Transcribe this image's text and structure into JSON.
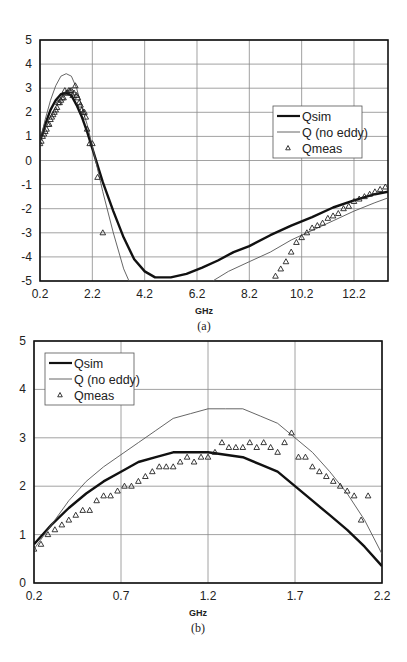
{
  "chart_data": [
    {
      "id": "a",
      "type": "line",
      "title": "",
      "caption": "(a)",
      "xlabel": "GHz",
      "ylabel": "",
      "xlim": [
        0.2,
        13.5
      ],
      "ylim": [
        -5,
        5
      ],
      "x_ticks": [
        "0.2",
        "2.2",
        "4.2",
        "6.2",
        "8.2",
        "10.2",
        "12.2"
      ],
      "y_ticks": [
        "5",
        "4",
        "3",
        "2",
        "1",
        "0",
        "-1",
        "-2",
        "-3",
        "-4",
        "-5"
      ],
      "grid": true,
      "legend": {
        "position": "right-middle",
        "entries": [
          "Qsim",
          "Q (no eddy)",
          "Qmeas"
        ]
      },
      "series": [
        {
          "name": "Qsim",
          "style": "thick-line",
          "x": [
            0.2,
            0.4,
            0.6,
            0.8,
            1.0,
            1.2,
            1.4,
            1.6,
            1.8,
            2.0,
            2.2,
            2.6,
            3.0,
            3.4,
            3.8,
            4.2,
            4.6,
            5.2,
            5.8,
            6.4,
            7.0,
            7.6,
            8.2,
            9.0,
            9.8,
            10.6,
            11.4,
            12.2,
            13.0,
            13.5
          ],
          "y": [
            0.8,
            1.5,
            2.1,
            2.5,
            2.75,
            2.8,
            2.7,
            2.3,
            1.8,
            1.2,
            0.5,
            -0.9,
            -2.1,
            -3.2,
            -4.1,
            -4.6,
            -4.85,
            -4.85,
            -4.7,
            -4.45,
            -4.15,
            -3.8,
            -3.55,
            -3.1,
            -2.7,
            -2.35,
            -1.95,
            -1.65,
            -1.4,
            -1.3
          ]
        },
        {
          "name": "Q (no eddy)",
          "style": "thin-line",
          "x": [
            0.2,
            0.4,
            0.6,
            0.8,
            1.0,
            1.2,
            1.4,
            1.6,
            1.8,
            2.0,
            2.2,
            2.6,
            3.0,
            3.4,
            3.6,
            6.8,
            7.4,
            8.2,
            9.0,
            9.8,
            10.6,
            11.4,
            12.2,
            13.0,
            13.5
          ],
          "y": [
            0.8,
            1.7,
            2.5,
            3.1,
            3.5,
            3.6,
            3.5,
            3.0,
            2.2,
            1.5,
            0.6,
            -1.3,
            -3.0,
            -4.5,
            -5.0,
            -5.0,
            -4.6,
            -4.2,
            -3.8,
            -3.3,
            -2.9,
            -2.5,
            -2.1,
            -1.75,
            -1.55
          ]
        },
        {
          "name": "Qmeas",
          "style": "triangle-markers",
          "x": [
            0.2,
            0.25,
            0.3,
            0.35,
            0.4,
            0.45,
            0.5,
            0.55,
            0.6,
            0.65,
            0.7,
            0.75,
            0.8,
            0.85,
            0.9,
            0.95,
            1.0,
            1.05,
            1.1,
            1.15,
            1.2,
            1.25,
            1.3,
            1.35,
            1.4,
            1.45,
            1.5,
            1.55,
            1.6,
            1.65,
            1.7,
            1.75,
            1.8,
            1.85,
            1.9,
            1.95,
            2.0,
            2.1,
            2.2,
            2.4,
            2.6,
            9.2,
            9.4,
            9.6,
            9.8,
            10.0,
            10.2,
            10.4,
            10.6,
            10.8,
            11.0,
            11.2,
            11.4,
            11.6,
            11.8,
            12.0,
            12.2,
            12.4,
            12.6,
            12.8,
            13.0,
            13.2,
            13.4
          ],
          "y": [
            0.7,
            0.8,
            1.0,
            1.1,
            1.2,
            1.3,
            1.5,
            1.5,
            1.7,
            1.8,
            1.9,
            2.0,
            2.1,
            2.2,
            2.4,
            2.4,
            2.5,
            2.6,
            2.6,
            2.9,
            2.8,
            2.8,
            2.9,
            2.9,
            2.9,
            2.7,
            2.8,
            3.1,
            2.7,
            2.6,
            2.4,
            2.3,
            2.1,
            2.0,
            2.0,
            1.8,
            1.3,
            0.7,
            0.7,
            -0.7,
            -3.0,
            -4.8,
            -4.5,
            -4.2,
            -3.8,
            -3.4,
            -3.2,
            -3.0,
            -2.8,
            -2.7,
            -2.6,
            -2.4,
            -2.3,
            -2.2,
            -2.0,
            -1.9,
            -1.7,
            -1.6,
            -1.5,
            -1.4,
            -1.3,
            -1.2,
            -1.1
          ]
        }
      ]
    },
    {
      "id": "b",
      "type": "line",
      "title": "",
      "caption": "(b)",
      "xlabel": "GHz",
      "ylabel": "",
      "xlim": [
        0.2,
        2.2
      ],
      "ylim": [
        0,
        5
      ],
      "x_ticks": [
        "0.2",
        "0.7",
        "1.2",
        "1.7",
        "2.2"
      ],
      "y_ticks": [
        "5",
        "4",
        "3",
        "2",
        "1",
        "0"
      ],
      "grid": true,
      "legend": {
        "position": "top-left",
        "entries": [
          "Qsim",
          "Q (no eddy)",
          "Qmeas"
        ]
      },
      "series": [
        {
          "name": "Qsim",
          "style": "thick-line",
          "x": [
            0.2,
            0.3,
            0.4,
            0.5,
            0.6,
            0.7,
            0.8,
            0.9,
            1.0,
            1.1,
            1.2,
            1.3,
            1.4,
            1.5,
            1.6,
            1.7,
            1.8,
            1.9,
            2.0,
            2.1,
            2.2
          ],
          "y": [
            0.8,
            1.2,
            1.55,
            1.85,
            2.1,
            2.3,
            2.5,
            2.6,
            2.7,
            2.7,
            2.7,
            2.65,
            2.6,
            2.45,
            2.3,
            2.0,
            1.7,
            1.4,
            1.1,
            0.75,
            0.35
          ]
        },
        {
          "name": "Q (no eddy)",
          "style": "thin-line",
          "x": [
            0.2,
            0.3,
            0.4,
            0.5,
            0.6,
            0.7,
            0.8,
            0.9,
            1.0,
            1.1,
            1.2,
            1.3,
            1.4,
            1.5,
            1.6,
            1.7,
            1.8,
            1.9,
            2.0,
            2.1,
            2.2
          ],
          "y": [
            0.7,
            1.2,
            1.7,
            2.1,
            2.4,
            2.65,
            2.9,
            3.15,
            3.4,
            3.5,
            3.6,
            3.6,
            3.6,
            3.45,
            3.3,
            3.0,
            2.7,
            2.3,
            1.85,
            1.3,
            0.6
          ]
        },
        {
          "name": "Qmeas",
          "style": "triangle-markers",
          "x": [
            0.2,
            0.24,
            0.28,
            0.32,
            0.36,
            0.4,
            0.44,
            0.48,
            0.52,
            0.56,
            0.6,
            0.64,
            0.68,
            0.72,
            0.76,
            0.8,
            0.84,
            0.88,
            0.92,
            0.96,
            1.0,
            1.04,
            1.08,
            1.12,
            1.16,
            1.2,
            1.24,
            1.28,
            1.32,
            1.36,
            1.4,
            1.44,
            1.48,
            1.52,
            1.56,
            1.6,
            1.64,
            1.68,
            1.72,
            1.76,
            1.8,
            1.84,
            1.88,
            1.92,
            1.96,
            2.0,
            2.04,
            2.08,
            2.12
          ],
          "y": [
            0.7,
            0.8,
            1.0,
            1.1,
            1.2,
            1.3,
            1.4,
            1.5,
            1.5,
            1.7,
            1.8,
            1.8,
            1.9,
            2.0,
            2.0,
            2.1,
            2.2,
            2.3,
            2.4,
            2.4,
            2.4,
            2.5,
            2.6,
            2.5,
            2.6,
            2.6,
            2.7,
            2.9,
            2.8,
            2.8,
            2.8,
            2.9,
            2.8,
            2.9,
            2.8,
            2.7,
            2.9,
            3.1,
            2.6,
            2.6,
            2.4,
            2.3,
            2.2,
            2.1,
            2.0,
            1.9,
            1.8,
            1.3,
            1.8
          ]
        }
      ]
    }
  ]
}
